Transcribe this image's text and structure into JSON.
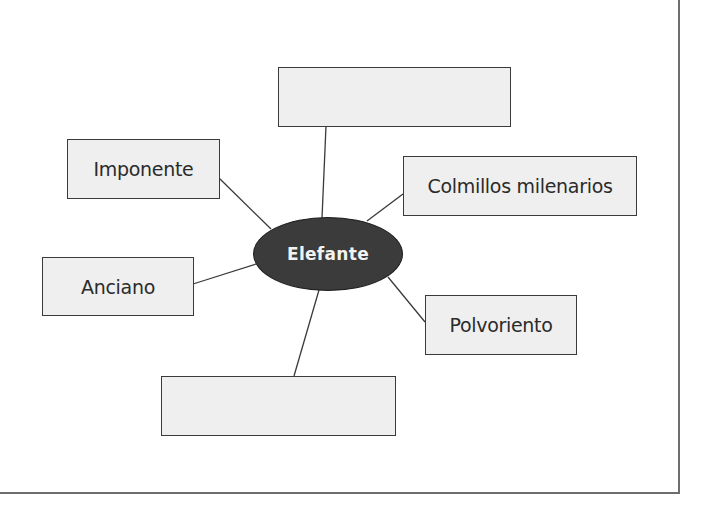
{
  "diagram": {
    "type": "concept-web",
    "center": {
      "label": "Elefante",
      "fill": "#3b3b3b",
      "text_color": "#f2f2f2"
    },
    "nodes": [
      {
        "id": "top",
        "label": "",
        "empty": true
      },
      {
        "id": "imponente",
        "label": "Imponente",
        "empty": false
      },
      {
        "id": "colmillos",
        "label": "Colmillos milenarios",
        "empty": false
      },
      {
        "id": "anciano",
        "label": "Anciano",
        "empty": false
      },
      {
        "id": "polvoriento",
        "label": "Polvoriento",
        "empty": false
      },
      {
        "id": "bottom",
        "label": "",
        "empty": true
      }
    ],
    "colors": {
      "box_fill": "#efefef",
      "box_border": "#3a3a3a",
      "connector": "#3a3a3a",
      "frame": "#6e6e6e"
    }
  }
}
